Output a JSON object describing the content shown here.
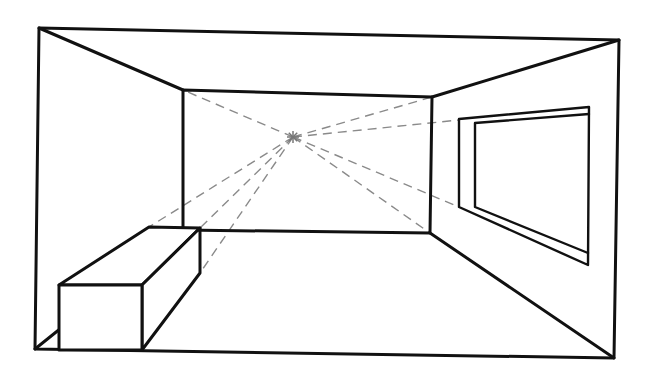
{
  "diagram": {
    "type": "one-point-perspective-room",
    "colors": {
      "line": "#111111",
      "construction": "#8a8a8a",
      "background": "#ffffff"
    },
    "vanishing_point": [
      293,
      137
    ],
    "room": {
      "outer_frame": [
        [
          39,
          28
        ],
        [
          619,
          40
        ],
        [
          614,
          358
        ],
        [
          35,
          349
        ]
      ],
      "back_wall": [
        [
          183,
          90
        ],
        [
          432,
          97
        ],
        [
          430,
          233
        ],
        [
          183,
          230
        ]
      ]
    },
    "box": {
      "front_face": [
        [
          59,
          285
        ],
        [
          142,
          285
        ],
        [
          142,
          350
        ],
        [
          59,
          350
        ]
      ],
      "top_back_left": [
        149,
        227
      ],
      "top_back_right": [
        200,
        228
      ],
      "side_back_bottom": [
        200,
        273
      ]
    },
    "window": {
      "outer_top_left": [
        459,
        119
      ],
      "outer_top_right": [
        589,
        107
      ],
      "outer_bottom_right": [
        588,
        265
      ],
      "outer_bottom_left": [
        459,
        207
      ],
      "inner_top_left": [
        475,
        123
      ],
      "inner_top_right": [
        589,
        114
      ],
      "inner_bottom_left": [
        475,
        207
      ],
      "inner_bottom_right": [
        588,
        253
      ]
    },
    "construction_lines": [
      [
        [
          293,
          137
        ],
        [
          183,
          90
        ]
      ],
      [
        [
          293,
          137
        ],
        [
          432,
          97
        ]
      ],
      [
        [
          293,
          137
        ],
        [
          459,
          120
        ]
      ],
      [
        [
          293,
          137
        ],
        [
          459,
          207
        ]
      ],
      [
        [
          293,
          137
        ],
        [
          430,
          233
        ]
      ],
      [
        [
          293,
          137
        ],
        [
          149,
          227
        ]
      ],
      [
        [
          293,
          137
        ],
        [
          200,
          228
        ]
      ],
      [
        [
          293,
          137
        ],
        [
          200,
          273
        ]
      ]
    ]
  }
}
